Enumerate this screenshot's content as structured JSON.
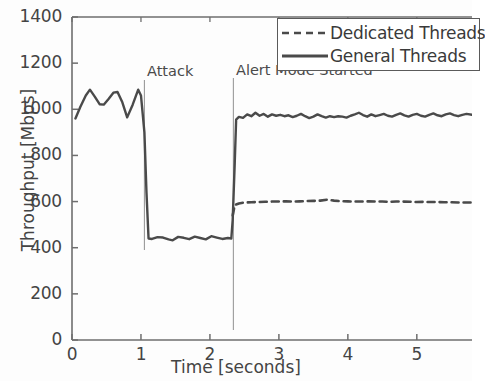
{
  "chart_data": {
    "type": "line",
    "title": "",
    "xlabel": "Time [seconds]",
    "ylabel": "Throughput [Mbps]",
    "xlim": [
      0,
      5.8
    ],
    "ylim": [
      0,
      1400
    ],
    "xticks": [
      0,
      1,
      2,
      3,
      4,
      5
    ],
    "xtick_labels": [
      "0",
      "1",
      "2",
      "3",
      "4",
      "5"
    ],
    "yticks": [
      0,
      200,
      400,
      600,
      800,
      1000,
      1200,
      1400
    ],
    "ytick_labels": [
      "0",
      "200",
      "400",
      "600",
      "800",
      "1000",
      "1200",
      "1400"
    ],
    "grid": false,
    "legend_position": "top-right",
    "annotations": [
      {
        "text": "Attack",
        "x": 1.05,
        "y": 1200,
        "label_x": 1.09,
        "label_y": 1200
      },
      {
        "text": "Alert Mode Started",
        "x": 2.34,
        "y": 1120,
        "label_x": 2.38,
        "label_y": 1120
      }
    ],
    "series": [
      {
        "name": "Dedicated Threads",
        "style": "dashed",
        "color": "#4a4a4a",
        "points": [
          [
            2.33,
            540
          ],
          [
            2.36,
            585
          ],
          [
            2.42,
            592
          ],
          [
            2.5,
            596
          ],
          [
            2.6,
            597
          ],
          [
            2.7,
            598
          ],
          [
            2.8,
            599
          ],
          [
            2.9,
            600
          ],
          [
            3.0,
            600
          ],
          [
            3.1,
            601
          ],
          [
            3.2,
            600
          ],
          [
            3.3,
            601
          ],
          [
            3.4,
            602
          ],
          [
            3.5,
            603
          ],
          [
            3.6,
            604
          ],
          [
            3.7,
            608
          ],
          [
            3.8,
            604
          ],
          [
            3.9,
            602
          ],
          [
            4.0,
            601
          ],
          [
            4.1,
            600
          ],
          [
            4.2,
            600
          ],
          [
            4.3,
            601
          ],
          [
            4.4,
            600
          ],
          [
            4.5,
            600
          ],
          [
            4.6,
            599
          ],
          [
            4.7,
            600
          ],
          [
            4.8,
            600
          ],
          [
            4.9,
            599
          ],
          [
            5.0,
            598
          ],
          [
            5.1,
            599
          ],
          [
            5.2,
            598
          ],
          [
            5.3,
            598
          ],
          [
            5.4,
            597
          ],
          [
            5.5,
            597
          ],
          [
            5.6,
            596
          ],
          [
            5.7,
            596
          ],
          [
            5.8,
            596
          ]
        ]
      },
      {
        "name": "General Threads",
        "style": "solid",
        "color": "#4a4a4a",
        "points": [
          [
            0.05,
            960
          ],
          [
            0.12,
            1010
          ],
          [
            0.2,
            1060
          ],
          [
            0.26,
            1085
          ],
          [
            0.33,
            1055
          ],
          [
            0.4,
            1022
          ],
          [
            0.46,
            1020
          ],
          [
            0.53,
            1045
          ],
          [
            0.6,
            1072
          ],
          [
            0.66,
            1075
          ],
          [
            0.73,
            1030
          ],
          [
            0.8,
            965
          ],
          [
            0.88,
            1020
          ],
          [
            0.96,
            1085
          ],
          [
            1.0,
            1060
          ],
          [
            1.05,
            900
          ],
          [
            1.08,
            640
          ],
          [
            1.11,
            440
          ],
          [
            1.16,
            438
          ],
          [
            1.24,
            446
          ],
          [
            1.32,
            444
          ],
          [
            1.4,
            436
          ],
          [
            1.46,
            432
          ],
          [
            1.54,
            447
          ],
          [
            1.62,
            443
          ],
          [
            1.7,
            437
          ],
          [
            1.78,
            448
          ],
          [
            1.86,
            442
          ],
          [
            1.94,
            436
          ],
          [
            2.02,
            450
          ],
          [
            2.1,
            444
          ],
          [
            2.18,
            438
          ],
          [
            2.26,
            442
          ],
          [
            2.31,
            440
          ],
          [
            2.33,
            520
          ],
          [
            2.36,
            770
          ],
          [
            2.38,
            955
          ],
          [
            2.42,
            967
          ],
          [
            2.48,
            963
          ],
          [
            2.54,
            978
          ],
          [
            2.6,
            970
          ],
          [
            2.66,
            985
          ],
          [
            2.72,
            972
          ],
          [
            2.78,
            980
          ],
          [
            2.84,
            968
          ],
          [
            2.9,
            978
          ],
          [
            2.96,
            972
          ],
          [
            3.02,
            976
          ],
          [
            3.08,
            970
          ],
          [
            3.14,
            974
          ],
          [
            3.2,
            966
          ],
          [
            3.26,
            972
          ],
          [
            3.32,
            980
          ],
          [
            3.38,
            970
          ],
          [
            3.44,
            962
          ],
          [
            3.5,
            968
          ],
          [
            3.56,
            978
          ],
          [
            3.62,
            970
          ],
          [
            3.68,
            964
          ],
          [
            3.74,
            970
          ],
          [
            3.8,
            966
          ],
          [
            3.86,
            970
          ],
          [
            3.92,
            968
          ],
          [
            3.98,
            964
          ],
          [
            4.04,
            972
          ],
          [
            4.1,
            978
          ],
          [
            4.16,
            985
          ],
          [
            4.22,
            975
          ],
          [
            4.28,
            968
          ],
          [
            4.34,
            978
          ],
          [
            4.4,
            970
          ],
          [
            4.46,
            975
          ],
          [
            4.52,
            980
          ],
          [
            4.58,
            972
          ],
          [
            4.64,
            968
          ],
          [
            4.7,
            976
          ],
          [
            4.76,
            982
          ],
          [
            4.82,
            974
          ],
          [
            4.88,
            968
          ],
          [
            4.94,
            976
          ],
          [
            5.0,
            980
          ],
          [
            5.06,
            972
          ],
          [
            5.12,
            968
          ],
          [
            5.18,
            976
          ],
          [
            5.24,
            982
          ],
          [
            5.3,
            974
          ],
          [
            5.36,
            970
          ],
          [
            5.42,
            978
          ],
          [
            5.48,
            982
          ],
          [
            5.54,
            975
          ],
          [
            5.6,
            970
          ],
          [
            5.66,
            976
          ],
          [
            5.72,
            980
          ],
          [
            5.8,
            976
          ]
        ]
      }
    ]
  },
  "legend": {
    "items": [
      {
        "label": "Dedicated Threads",
        "style": "dashed"
      },
      {
        "label": "General Threads",
        "style": "solid"
      }
    ]
  },
  "axes": {
    "ylabel": "Throughput [Mbps]",
    "xlabel": "Time [seconds]"
  }
}
